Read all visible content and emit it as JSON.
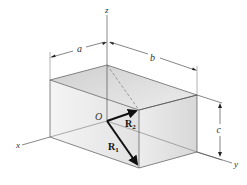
{
  "figure": {
    "type": "3D rectangular box with position vectors",
    "axes": {
      "x": "x",
      "y": "y",
      "z": "z"
    },
    "origin_label": "O",
    "dimensions": {
      "a": "a",
      "b": "b",
      "c": "c"
    },
    "vectors": [
      {
        "name": "R",
        "subscript": "1",
        "from": "O",
        "to": "front-bottom corner"
      },
      {
        "name": "R",
        "subscript": "2",
        "from": "O",
        "to": "front-top-near corner"
      }
    ],
    "colors": {
      "face_fill": "#e6e6e6",
      "top_fill": "#d9d9d9",
      "edge": "#555555",
      "vector": "#111111"
    }
  }
}
